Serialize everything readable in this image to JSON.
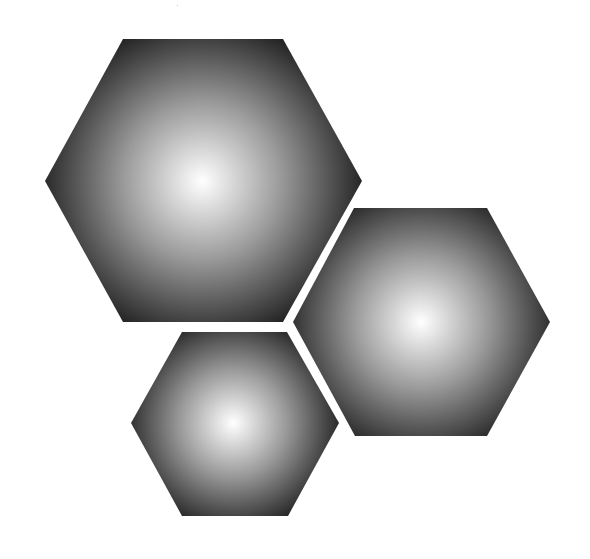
{
  "illustration": {
    "title": "Three hexagons with radial gradients",
    "background_color": "#ffffff",
    "gradient": {
      "center_color": "#ffffff",
      "mid_color": "#9a9a9a",
      "edge_color": "#111111"
    },
    "shapes": [
      {
        "name": "large-hexagon",
        "kind": "hexagon",
        "label": "Large hexagon"
      },
      {
        "name": "right-hexagon",
        "kind": "hexagon",
        "label": "Right hexagon"
      },
      {
        "name": "small-hexagon",
        "kind": "hexagon",
        "label": "Small hexagon"
      }
    ]
  }
}
